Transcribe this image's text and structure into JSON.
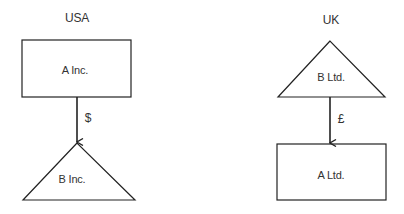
{
  "diagram": {
    "left": {
      "country": "USA",
      "parent": {
        "label": "A Inc.",
        "shape": "rectangle"
      },
      "flow": {
        "currency": "$",
        "direction": "down"
      },
      "child": {
        "label": "B Inc.",
        "shape": "triangle"
      }
    },
    "right": {
      "country": "UK",
      "parent": {
        "label": "B Ltd.",
        "shape": "triangle"
      },
      "flow": {
        "currency": "£",
        "direction": "down"
      },
      "child": {
        "label": "A Ltd.",
        "shape": "rectangle"
      }
    }
  }
}
